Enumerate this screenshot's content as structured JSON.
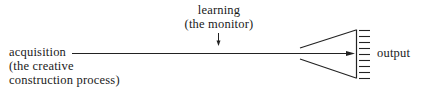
{
  "diagram": {
    "monitor": {
      "label_line1": "learning",
      "label_line2": "(the monitor)"
    },
    "input": {
      "label_line1": "acquisition",
      "label_line2": "(the creative",
      "label_line3": "construction process)"
    },
    "output": {
      "label": "output"
    },
    "colors": {
      "stroke": "#222222",
      "text": "#1a1a1a",
      "background": "#ffffff"
    },
    "comb_ticks": 9
  }
}
